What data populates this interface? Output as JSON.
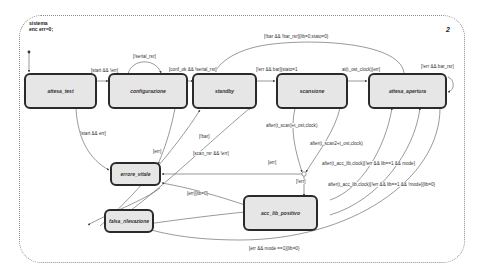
{
  "chart": {
    "header_lines": [
      "sistema",
      "enc err=0;"
    ],
    "page_number": "2"
  },
  "states": [
    {
      "id": "attesa_test",
      "label": "attesa_test"
    },
    {
      "id": "configurazione",
      "label": "configurazione"
    },
    {
      "id": "standby",
      "label": "standby"
    },
    {
      "id": "scansione",
      "label": "scansione"
    },
    {
      "id": "attesa_apertura",
      "label": "attesa_apertura"
    },
    {
      "id": "errore_vitale",
      "label": "errore_vitale"
    },
    {
      "id": "acc_lib_positivo",
      "label": "acc_lib_positivo"
    },
    {
      "id": "falsa_rilevazione",
      "label": "falsa_rilevazione"
    }
  ],
  "transitions": [
    {
      "from": "attesa_test",
      "to": "configurazione",
      "label": "[start && !err]"
    },
    {
      "from": "configurazione",
      "to": "configurazione",
      "label": "[!serial_rsr]"
    },
    {
      "from": "configurazione",
      "to": "standby",
      "label": "[conf_ok && !serial_rsr]"
    },
    {
      "from": "standby",
      "to": "scansione",
      "label": "[!err && bar]{stato=1"
    },
    {
      "from": "attesa_apertura",
      "to": "standby",
      "label": "[!bar && !bar_rsr]{lib=0;stato=0}"
    },
    {
      "from": "scansione",
      "to": "attesa_apertura",
      "label": "at(t_ost_clock)[err]"
    },
    {
      "from": "attesa_apertura",
      "to": "attesa_apertura",
      "label": "[!err && bar_rsr]"
    },
    {
      "from": "attesa_test",
      "to": "errore_vitale",
      "label": "[start && err]"
    },
    {
      "from": "configurazione",
      "to": "errore_vitale",
      "label": "[err]"
    },
    {
      "from": "falsa_rilevazione",
      "to": "standby",
      "label": "[!bar]"
    },
    {
      "from": "falsa_rilevazione",
      "to": "standby",
      "label": "[scan_rsr && !err]"
    },
    {
      "from": "scansione",
      "to": "junction",
      "label": "after(t_scan]+t_ost,clock)"
    },
    {
      "from": "scansione",
      "to": "junction",
      "label": "after(t_scan2+t_ost,clock)"
    },
    {
      "from": "junction",
      "to": "errore_vitale",
      "label": "[err]"
    },
    {
      "from": "junction",
      "to": "acc_lib_positivo",
      "label": "[!err]"
    },
    {
      "from": "acc_lib_positivo",
      "to": "attesa_apertura",
      "label": "after(t_acc_lib,clock)[!err && lib==1 && mode]"
    },
    {
      "from": "acc_lib_positivo",
      "to": "attesa_apertura",
      "label": "after(t_acc_lib,clock)[!err && lib==1 && !mode]{lib=0}"
    },
    {
      "from": "acc_lib_positivo",
      "to": "errore_vitale",
      "label": "[err]{lib=0}"
    },
    {
      "from": "acc_lib_positivo",
      "to": "falsa_rilevazione",
      "label": "[err && mode ==1]{lib=0}"
    }
  ],
  "colors": {
    "state_fill": "#e6e6e6",
    "state_border": "#2a2a2a",
    "edge": "#444444",
    "frame": "#8a8a8a"
  }
}
